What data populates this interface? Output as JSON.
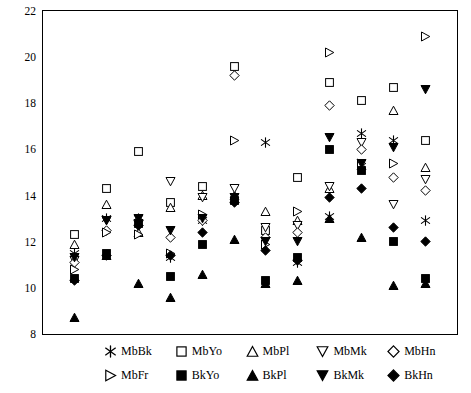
{
  "chart_data": {
    "type": "scatter",
    "title": "",
    "xlabel": "",
    "ylabel": "",
    "ylim": [
      8,
      22
    ],
    "yticks": [
      8,
      10,
      12,
      14,
      16,
      18,
      20,
      22
    ],
    "ytick_labels": [
      "8",
      "10",
      "12",
      "14",
      "16",
      "18",
      "20",
      "22"
    ],
    "xlim": [
      0,
      13
    ],
    "xticks": [],
    "xtick_labels": [],
    "grid": false,
    "legend_position": "below-plot",
    "series": [
      {
        "name": "MbBk",
        "marker": "asterisk",
        "fill": "open",
        "x": [
          1,
          2,
          3,
          4,
          5,
          6,
          7,
          8,
          9,
          10,
          11,
          12
        ],
        "values": [
          11.5,
          13.0,
          13.0,
          11.3,
          12.9,
          13.8,
          16.3,
          11.1,
          13.1,
          16.7,
          16.4,
          12.9
        ]
      },
      {
        "name": "MbYo",
        "marker": "square",
        "fill": "open",
        "x": [
          1,
          2,
          3,
          4,
          5,
          6,
          7,
          8,
          9,
          10,
          11,
          12
        ],
        "values": [
          12.3,
          14.3,
          15.9,
          13.7,
          14.4,
          19.6,
          12.5,
          14.8,
          18.9,
          18.1,
          18.7,
          16.4
        ]
      },
      {
        "name": "MbPl",
        "marker": "triangle-up",
        "fill": "open",
        "x": [
          1,
          2,
          3,
          4,
          5,
          6,
          7,
          8,
          9,
          10,
          11,
          12
        ],
        "values": [
          11.9,
          13.6,
          12.4,
          13.5,
          14.0,
          14.0,
          13.3,
          12.9,
          14.3,
          15.3,
          17.7,
          15.2
        ]
      },
      {
        "name": "MbMk",
        "marker": "triangle-down",
        "fill": "open",
        "x": [
          1,
          2,
          3,
          4,
          5,
          6,
          7,
          8,
          9,
          10,
          11,
          12
        ],
        "values": [
          11.2,
          12.9,
          12.8,
          14.6,
          13.9,
          14.3,
          12.6,
          12.7,
          14.4,
          16.3,
          13.6,
          14.7
        ]
      },
      {
        "name": "MbHn",
        "marker": "diamond",
        "fill": "open",
        "x": [
          1,
          2,
          3,
          4,
          5,
          6,
          7,
          8,
          9,
          10,
          11,
          12
        ],
        "values": [
          11.1,
          12.5,
          12.9,
          12.2,
          12.9,
          19.2,
          12.2,
          12.4,
          17.9,
          16.0,
          14.8,
          14.2
        ]
      },
      {
        "name": "MbFr",
        "marker": "triangle-right",
        "fill": "open",
        "x": [
          1,
          2,
          3,
          4,
          5,
          6,
          7,
          8,
          9,
          10,
          11,
          12
        ],
        "values": [
          10.8,
          12.4,
          12.3,
          11.5,
          13.2,
          16.4,
          11.9,
          13.3,
          20.2,
          15.4,
          15.4,
          20.9
        ]
      },
      {
        "name": "BkYo",
        "marker": "square",
        "fill": "filled",
        "x": [
          1,
          2,
          3,
          4,
          5,
          6,
          7,
          8,
          9,
          10,
          11,
          12
        ],
        "values": [
          10.4,
          11.5,
          12.8,
          10.5,
          11.9,
          13.8,
          10.3,
          11.3,
          16.0,
          15.1,
          12.0,
          10.4
        ]
      },
      {
        "name": "BkPl",
        "marker": "triangle-up",
        "fill": "filled",
        "x": [
          1,
          2,
          3,
          4,
          5,
          6,
          7,
          8,
          9,
          10,
          11,
          12
        ],
        "values": [
          8.7,
          11.4,
          10.2,
          9.6,
          10.6,
          12.1,
          10.2,
          10.3,
          13.0,
          12.2,
          10.1,
          10.2
        ]
      },
      {
        "name": "BkMk",
        "marker": "triangle-down",
        "fill": "filled",
        "x": [
          1,
          2,
          3,
          4,
          5,
          6,
          7,
          8,
          9,
          10,
          11,
          12
        ],
        "values": [
          11.3,
          12.9,
          13.0,
          12.5,
          13.0,
          13.9,
          12.0,
          12.0,
          16.5,
          15.4,
          16.1,
          18.6
        ]
      },
      {
        "name": "BkHn",
        "marker": "diamond",
        "fill": "filled",
        "x": [
          1,
          2,
          3,
          4,
          5,
          6,
          7,
          8,
          9,
          10,
          11,
          12
        ],
        "values": [
          10.3,
          11.4,
          12.7,
          11.4,
          12.4,
          13.7,
          11.6,
          11.2,
          13.9,
          14.3,
          12.6,
          12.0
        ]
      }
    ],
    "legend": [
      {
        "label": "MbBk",
        "marker": "asterisk",
        "fill": "open"
      },
      {
        "label": "MbYo",
        "marker": "square",
        "fill": "open"
      },
      {
        "label": "MbPl",
        "marker": "triangle-up",
        "fill": "open"
      },
      {
        "label": "MbMk",
        "marker": "triangle-down",
        "fill": "open"
      },
      {
        "label": "MbHn",
        "marker": "diamond",
        "fill": "open"
      },
      {
        "label": "MbFr",
        "marker": "triangle-right",
        "fill": "open"
      },
      {
        "label": "BkYo",
        "marker": "square",
        "fill": "filled"
      },
      {
        "label": "BkPl",
        "marker": "triangle-up",
        "fill": "filled"
      },
      {
        "label": "BkMk",
        "marker": "triangle-down",
        "fill": "filled"
      },
      {
        "label": "BkHn",
        "marker": "diamond",
        "fill": "filled"
      }
    ]
  }
}
